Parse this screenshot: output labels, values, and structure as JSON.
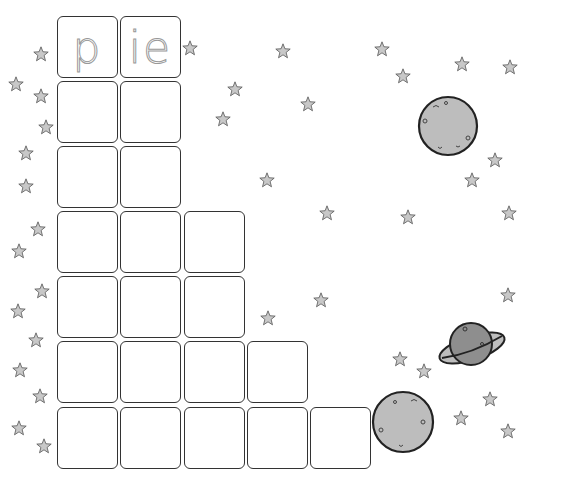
{
  "worksheet": {
    "word_tiles": [
      "p",
      "ie"
    ],
    "word": "pie",
    "grid": {
      "columns_x": [
        57,
        120,
        184,
        247,
        310
      ],
      "rows_y": [
        16,
        81,
        146,
        211,
        276,
        341,
        407
      ],
      "row_lengths": [
        2,
        2,
        2,
        3,
        3,
        4,
        5
      ]
    }
  },
  "decorations": {
    "stars": [
      [
        41,
        54
      ],
      [
        190,
        48
      ],
      [
        283,
        51
      ],
      [
        382,
        49
      ],
      [
        16,
        84
      ],
      [
        41,
        96
      ],
      [
        235,
        89
      ],
      [
        462,
        64
      ],
      [
        510,
        67
      ],
      [
        403,
        76
      ],
      [
        46,
        127
      ],
      [
        223,
        119
      ],
      [
        308,
        104
      ],
      [
        26,
        153
      ],
      [
        495,
        160
      ],
      [
        472,
        180
      ],
      [
        26,
        186
      ],
      [
        267,
        180
      ],
      [
        327,
        213
      ],
      [
        408,
        217
      ],
      [
        509,
        213
      ],
      [
        38,
        229
      ],
      [
        19,
        251
      ],
      [
        42,
        291
      ],
      [
        18,
        311
      ],
      [
        268,
        318
      ],
      [
        321,
        300
      ],
      [
        508,
        295
      ],
      [
        36,
        340
      ],
      [
        400,
        359
      ],
      [
        20,
        370
      ],
      [
        424,
        371
      ],
      [
        40,
        396
      ],
      [
        490,
        399
      ],
      [
        461,
        418
      ],
      [
        19,
        428
      ],
      [
        44,
        446
      ],
      [
        508,
        431
      ]
    ],
    "planets": [
      {
        "name": "moon-top",
        "cx": 448,
        "cy": 126,
        "r": 29
      },
      {
        "name": "moon-bottom",
        "cx": 403,
        "cy": 422,
        "r": 30
      },
      {
        "name": "ringed-planet",
        "cx": 471,
        "cy": 344
      }
    ],
    "colors": {
      "star_fill": "#c8c8c8",
      "planet_fill": "#bdbdbd",
      "ringed_fill": "#8e8e8e",
      "stroke": "#222222"
    }
  }
}
